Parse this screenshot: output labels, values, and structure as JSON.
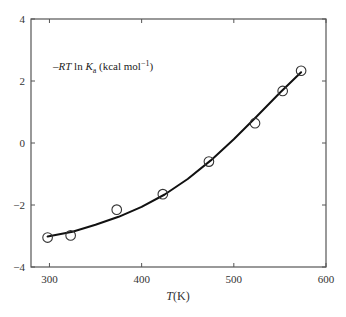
{
  "chart_data": {
    "type": "scatter",
    "title": "",
    "xlabel": "T (K)",
    "xlabel_italic": "T",
    "xlabel_unit": "(K)",
    "ylabel": "",
    "annotation": {
      "prefix": "–",
      "italic1": "RT",
      "mid": " ln ",
      "italic2": "K",
      "subscript": "a",
      "suffix": " (kcal mol",
      "superscript": "−1",
      "close": ")"
    },
    "xlim": [
      280,
      600
    ],
    "ylim": [
      -4,
      4
    ],
    "xticks": [
      300,
      400,
      500,
      600
    ],
    "yticks": [
      -4,
      -2,
      0,
      2,
      4
    ],
    "xtick_labels": [
      "300",
      "400",
      "500",
      "600"
    ],
    "ytick_labels": [
      "−4",
      "−2",
      "0",
      "2",
      "4"
    ],
    "grid": false,
    "legend": null,
    "series": [
      {
        "name": "measured",
        "marker": "open-circle",
        "x": [
          298,
          323,
          373,
          423,
          473,
          523,
          553,
          573
        ],
        "y": [
          -3.05,
          -2.98,
          -2.15,
          -1.65,
          -0.6,
          0.64,
          1.68,
          2.33
        ]
      },
      {
        "name": "fit",
        "style": "line",
        "x": [
          298,
          325,
          350,
          375,
          400,
          425,
          450,
          475,
          500,
          525,
          550,
          573
        ],
        "y": [
          -3.02,
          -2.86,
          -2.64,
          -2.38,
          -2.06,
          -1.66,
          -1.16,
          -0.56,
          0.12,
          0.86,
          1.62,
          2.28
        ]
      }
    ]
  }
}
